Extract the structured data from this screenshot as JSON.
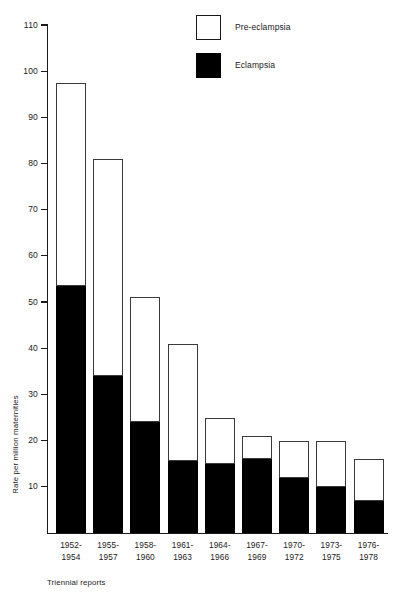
{
  "chart_data": {
    "type": "bar",
    "title": "",
    "subtitle": "",
    "xlabel": "Triennial reports",
    "ylabel": "Rate per million maternities",
    "ylim": [
      0,
      110
    ],
    "ytick_step": 10,
    "yticks": [
      0,
      10,
      20,
      30,
      40,
      50,
      60,
      70,
      80,
      90,
      100,
      110
    ],
    "ytick_labels": [
      "",
      "10",
      "20",
      "30",
      "40",
      "50",
      "60",
      "70",
      "80",
      "90",
      "100",
      "110"
    ],
    "grid": false,
    "stacked": true,
    "legend_position": "top-right",
    "categories": [
      "1952-1954",
      "1955-1957",
      "1958-1960",
      "1961-1963",
      "1964-1966",
      "1967-1969",
      "1970-1972",
      "1973-1975",
      "1976-1978"
    ],
    "category_lines": [
      [
        "1952-",
        "1954"
      ],
      [
        "1955-",
        "1957"
      ],
      [
        "1958-",
        "1960"
      ],
      [
        "1961-",
        "1963"
      ],
      [
        "1964-",
        "1966"
      ],
      [
        "1967-",
        "1969"
      ],
      [
        "1970-",
        "1972"
      ],
      [
        "1973-",
        "1975"
      ],
      [
        "1976-",
        "1978"
      ]
    ],
    "series": [
      {
        "name": "Eclampsia",
        "color": "#000000",
        "values": [
          53.5,
          34,
          24,
          15.5,
          15,
          16,
          12,
          10,
          7
        ]
      },
      {
        "name": "Pre-eclampsia",
        "color": "#ffffff",
        "values": [
          44,
          47,
          27,
          25.5,
          10,
          5,
          8,
          10,
          9
        ]
      }
    ],
    "totals": [
      97.5,
      81,
      51,
      41,
      25,
      21,
      20,
      20,
      16
    ]
  },
  "legend": {
    "items": [
      {
        "label": "Pre-eclampsia",
        "swatch": "open-square-swatch"
      },
      {
        "label": "Eclampsia",
        "swatch": "filled-square-swatch"
      }
    ]
  },
  "axes": {
    "y_title": "Rate per million maternities",
    "x_title": "Triennial reports"
  }
}
